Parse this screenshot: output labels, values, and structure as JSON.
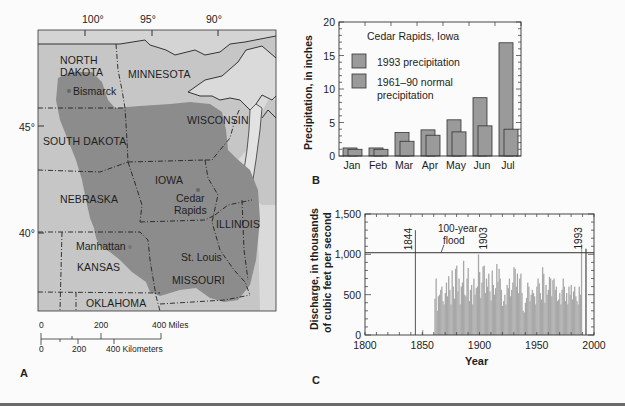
{
  "panels": {
    "a": {
      "letter": "A",
      "longitudes": [
        "100°",
        "95°",
        "90°"
      ],
      "latitudes": [
        "45°",
        "40°"
      ],
      "states": [
        "NORTH",
        "DAKOTA",
        "MINNESOTA",
        "WISCONSIN",
        "SOUTH DAKOTA",
        "IOWA",
        "NEBRASKA",
        "ILLINOIS",
        "KANSAS",
        "MISSOURI",
        "OKLAHOMA"
      ],
      "cities": [
        "Bismarck",
        "Cedar",
        "Rapids",
        "Manhattan",
        "St. Louis"
      ],
      "scale": {
        "miles": [
          "0",
          "200",
          "400 Miles"
        ],
        "km": [
          "0",
          "200",
          "400 Kilometers"
        ]
      },
      "colors": {
        "flooded_region": "#8c8c8c",
        "land": "#c4c4c4",
        "water": "#dcdcdc"
      }
    },
    "b": {
      "letter": "B"
    },
    "c": {
      "letter": "C"
    }
  },
  "chart_data": [
    {
      "type": "bar",
      "title": "Cedar Rapids, Iowa",
      "xlabel": "",
      "ylabel": "Precipitation, in inches",
      "ylim": [
        0,
        20
      ],
      "yticks": [
        "0",
        "5",
        "10",
        "15",
        "20"
      ],
      "categories": [
        "Jan",
        "Feb",
        "Mar",
        "Apr",
        "May",
        "Jun",
        "Jul"
      ],
      "series": [
        {
          "name": "1993 precipitation",
          "values": [
            1.2,
            1.2,
            3.5,
            3.9,
            5.4,
            8.7,
            16.9
          ]
        },
        {
          "name": "1961–90 normal precipitation",
          "values": [
            1.0,
            1.0,
            2.2,
            3.1,
            3.6,
            4.5,
            4.0
          ]
        }
      ],
      "legend": [
        "1993 precipitation",
        "1961–90 normal",
        "precipitation"
      ],
      "legend_position": "upper-left",
      "grid": false
    },
    {
      "type": "bar",
      "title": "",
      "xlabel": "Year",
      "ylabel": "Discharge, in thousands of cubic feet per second",
      "ylabel_lines": [
        "Discharge, in thousands",
        "of cubic feet per second"
      ],
      "xlim": [
        1800,
        2000
      ],
      "ylim": [
        0,
        1500
      ],
      "xticks": [
        "1800",
        "1850",
        "1900",
        "1950",
        "2000"
      ],
      "yticks": [
        "0",
        "500",
        "1,000",
        "1,500"
      ],
      "annotations": {
        "flood_label_1": "100-year",
        "flood_label_2": "flood",
        "flood_level": 1020,
        "marked_years": [
          "1844",
          "1903",
          "1993"
        ],
        "peak_1844": 1300,
        "peak_1993": 1070
      },
      "x": [
        1844,
        1861,
        1862,
        1863,
        1864,
        1865,
        1866,
        1867,
        1868,
        1869,
        1870,
        1871,
        1872,
        1873,
        1874,
        1875,
        1876,
        1877,
        1878,
        1879,
        1880,
        1881,
        1882,
        1883,
        1884,
        1885,
        1886,
        1887,
        1888,
        1889,
        1890,
        1891,
        1892,
        1893,
        1894,
        1895,
        1896,
        1897,
        1898,
        1899,
        1900,
        1901,
        1902,
        1903,
        1904,
        1905,
        1906,
        1907,
        1908,
        1909,
        1910,
        1911,
        1912,
        1913,
        1914,
        1915,
        1916,
        1917,
        1918,
        1919,
        1920,
        1921,
        1922,
        1923,
        1924,
        1925,
        1926,
        1927,
        1928,
        1929,
        1930,
        1931,
        1932,
        1933,
        1934,
        1935,
        1936,
        1937,
        1938,
        1939,
        1940,
        1941,
        1942,
        1943,
        1944,
        1945,
        1946,
        1947,
        1948,
        1949,
        1950,
        1951,
        1952,
        1953,
        1954,
        1955,
        1956,
        1957,
        1958,
        1959,
        1960,
        1961,
        1962,
        1963,
        1964,
        1965,
        1966,
        1967,
        1968,
        1969,
        1970,
        1971,
        1972,
        1973,
        1974,
        1975,
        1976,
        1977,
        1978,
        1979,
        1980,
        1981,
        1982,
        1983,
        1984,
        1985,
        1986,
        1987,
        1988,
        1989,
        1990,
        1991,
        1992,
        1993
      ],
      "values": [
        1300,
        450,
        700,
        300,
        480,
        500,
        560,
        600,
        420,
        380,
        520,
        650,
        480,
        730,
        560,
        380,
        800,
        600,
        450,
        820,
        860,
        540,
        700,
        380,
        600,
        650,
        920,
        500,
        480,
        700,
        830,
        420,
        560,
        620,
        380,
        700,
        500,
        580,
        600,
        1000,
        780,
        460,
        650,
        850,
        860,
        520,
        700,
        600,
        760,
        540,
        430,
        800,
        620,
        500,
        580,
        880,
        660,
        820,
        700,
        560,
        360,
        420,
        500,
        380,
        620,
        580,
        700,
        480,
        560,
        650,
        840,
        820,
        600,
        760,
        520,
        700,
        760,
        520,
        300,
        280,
        400,
        460,
        650,
        600,
        420,
        500,
        560,
        520,
        480,
        380,
        600,
        700,
        640,
        520,
        440,
        840,
        760,
        400,
        620,
        500,
        560,
        720,
        700,
        480,
        680,
        700,
        560,
        600,
        420,
        440,
        520,
        380,
        560,
        700,
        600,
        420,
        520,
        380,
        600,
        500,
        620,
        440,
        540,
        600,
        480,
        420,
        380,
        600,
        500,
        1070
      ],
      "grid": false
    }
  ]
}
